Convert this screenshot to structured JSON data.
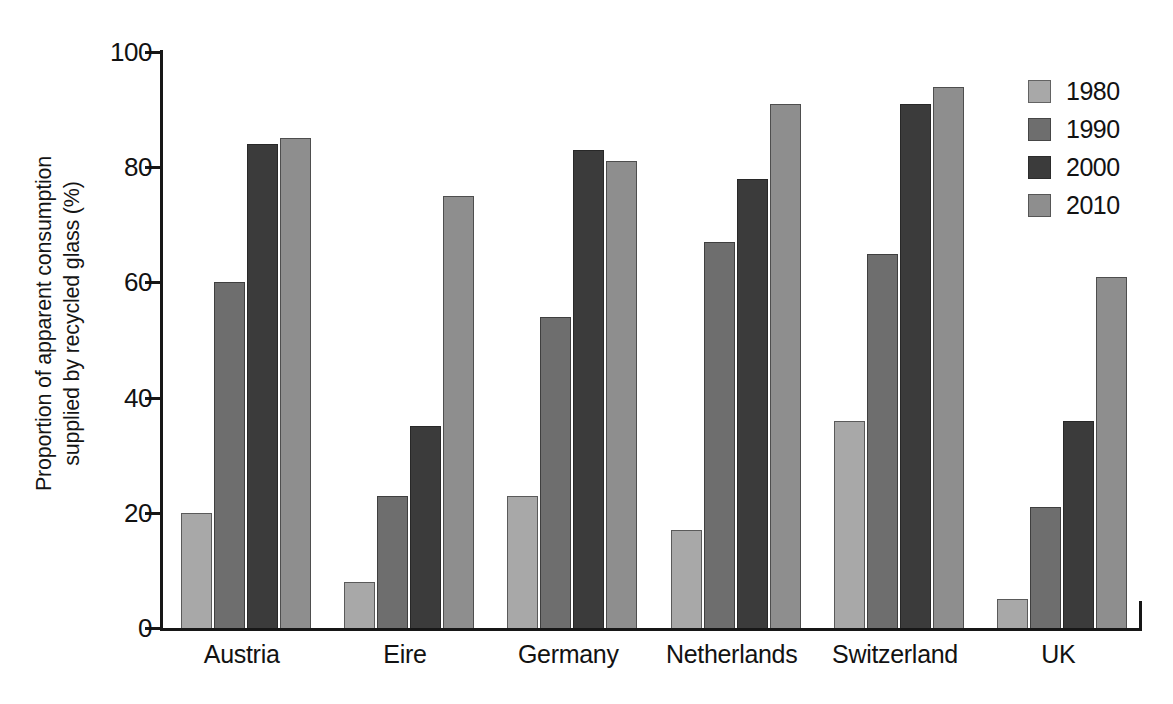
{
  "chart_data": {
    "type": "bar",
    "title": "",
    "xlabel": "",
    "ylabel": "Proportion of apparent consumption\nsupplied by recycled glass (%)",
    "ylim": [
      0,
      100
    ],
    "yticks": [
      0,
      20,
      40,
      60,
      80,
      100
    ],
    "ytick_labels": [
      "0",
      "20",
      "40",
      "60",
      "80",
      "100"
    ],
    "grid": false,
    "legend_position": "top-right",
    "categories": [
      "Austria",
      "Eire",
      "Germany",
      "Netherlands",
      "Switzerland",
      "UK"
    ],
    "series": [
      {
        "name": "1980",
        "color": "#a8a8a8",
        "values": [
          20,
          8,
          23,
          17,
          36,
          5
        ]
      },
      {
        "name": "1990",
        "color": "#6e6e6e",
        "values": [
          60,
          23,
          54,
          67,
          65,
          21
        ]
      },
      {
        "name": "2000",
        "color": "#3b3b3b",
        "values": [
          84,
          35,
          83,
          78,
          91,
          36
        ]
      },
      {
        "name": "2010",
        "color": "#8e8e8e",
        "values": [
          85,
          75,
          81,
          91,
          94,
          61
        ]
      }
    ]
  },
  "legend": {
    "items": [
      {
        "label": "1980"
      },
      {
        "label": "1990"
      },
      {
        "label": "2000"
      },
      {
        "label": "2010"
      }
    ]
  },
  "caption": ""
}
